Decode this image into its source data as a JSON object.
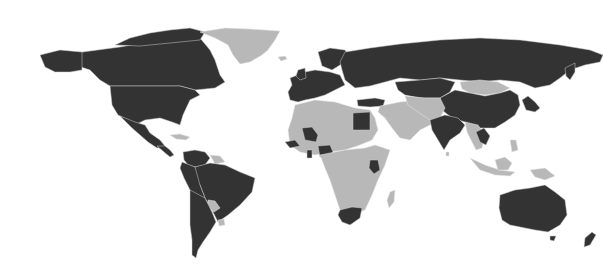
{
  "map": {
    "type": "world-choropleth",
    "projection": "equirectangular-like",
    "legend": "none",
    "categories": [
      {
        "name": "dark",
        "color": "#333333"
      },
      {
        "name": "light",
        "color": "#b8b8b8"
      }
    ],
    "background": "#ffffff",
    "regions": [
      {
        "id": "canada",
        "name": "Canada",
        "category": "dark",
        "points": "60,55 120,47 150,42 180,40 200,38 210,50 215,60 220,75 225,82 215,88 195,90 180,86 160,86 110,86 100,80 90,70 75,65 60,62"
      },
      {
        "id": "canada-arctic",
        "name": "Canadian Arctic Islands",
        "category": "dark",
        "points": "115,45 130,38 150,33 170,30 190,28 205,32 200,40 180,42 160,44 140,46"
      },
      {
        "id": "alaska",
        "name": "Alaska (USA)",
        "category": "dark",
        "points": "40,55 60,50 82,52 82,70 70,72 55,72 45,67"
      },
      {
        "id": "usa",
        "name": "United States",
        "category": "dark",
        "points": "110,86 160,86 180,86 195,90 200,95 190,100 183,115 180,125 172,122 160,118 145,120 135,125 128,120 118,115 112,105"
      },
      {
        "id": "mexico",
        "name": "Mexico",
        "category": "dark",
        "points": "120,116 135,122 145,125 150,133 160,140 165,146 157,148 148,142 140,135 132,128"
      },
      {
        "id": "central-america",
        "name": "Central America",
        "category": "dark",
        "points": "157,146 165,146 170,150 174,155 170,157 164,152"
      },
      {
        "id": "caribbean",
        "name": "Caribbean",
        "category": "light",
        "points": "170,135 180,134 190,137 186,140 176,139"
      },
      {
        "id": "greenland",
        "name": "Greenland",
        "category": "light",
        "points": "200,32 225,28 250,29 280,31 275,40 268,50 262,55 250,62 240,64 233,55 228,45 215,38"
      },
      {
        "id": "iceland",
        "name": "Iceland",
        "category": "light",
        "points": "278,57 285,56 287,59 281,61"
      },
      {
        "id": "colombia-venezuela",
        "name": "Colombia/Venezuela",
        "category": "dark",
        "points": "183,152 195,150 205,152 210,158 205,165 195,167 188,165 184,160"
      },
      {
        "id": "guianas",
        "name": "Guianas",
        "category": "light",
        "points": "210,155 220,156 225,162 215,164"
      },
      {
        "id": "brazil",
        "name": "Brazil",
        "category": "dark",
        "points": "195,167 210,163 225,165 240,172 255,178 252,192 240,205 228,215 218,222 212,210 205,198 200,185 195,178"
      },
      {
        "id": "peru-bolivia",
        "name": "Peru/Ecuador/Bolivia",
        "category": "dark",
        "points": "182,162 195,167 200,185 205,198 196,200 190,190 184,178 180,168"
      },
      {
        "id": "paraguay",
        "name": "Paraguay",
        "category": "light",
        "points": "208,200 215,201 220,208 214,212 208,206"
      },
      {
        "id": "uruguay",
        "name": "Uruguay",
        "category": "light",
        "points": "218,220 224,219 225,225 219,226"
      },
      {
        "id": "argentina-chile",
        "name": "Argentina/Chile",
        "category": "dark",
        "points": "190,190 205,198 212,212 216,222 210,232 203,242 198,250 196,258 192,255 192,240 190,225 190,210"
      },
      {
        "id": "western-europe",
        "name": "Western Europe",
        "category": "dark",
        "points": "290,78 305,72 315,70 330,72 340,75 345,85 335,90 325,95 315,98 305,100 298,102 290,100 288,92 292,85"
      },
      {
        "id": "scandinavia",
        "name": "Scandinavia",
        "category": "dark",
        "points": "318,52 330,48 345,50 350,58 340,65 332,70 322,66"
      },
      {
        "id": "uk-ireland",
        "name": "UK/Ireland",
        "category": "dark",
        "points": "298,70 305,68 306,78 300,80 296,76"
      },
      {
        "id": "russia",
        "name": "Russia",
        "category": "dark",
        "points": "345,52 370,48 400,44 440,40 480,38 520,40 560,45 590,50 603,55 600,62 585,65 570,70 560,78 550,85 535,88 520,82 500,80 480,82 460,80 440,78 420,80 400,78 385,82 370,86 355,88 345,80 342,70 340,62"
      },
      {
        "id": "kamchatka",
        "name": "Kamchatka",
        "category": "dark",
        "points": "565,68 575,63 575,72 570,80 566,76"
      },
      {
        "id": "kazakhstan-central-asia",
        "name": "Kazakhstan/Central Asia",
        "category": "dark",
        "points": "395,82 420,80 440,78 455,82 450,92 440,98 420,98 405,95 398,90"
      },
      {
        "id": "turkey",
        "name": "Turkey",
        "category": "dark",
        "points": "357,100 375,98 385,100 383,106 370,107 358,106"
      },
      {
        "id": "mongolia",
        "name": "Mongolia",
        "category": "light",
        "points": "460,82 480,80 498,82 510,88 500,93 485,95 470,93 462,89"
      },
      {
        "id": "china",
        "name": "China",
        "category": "dark",
        "points": "440,98 455,90 470,93 485,96 500,93 510,90 518,95 520,105 515,115 505,122 495,128 480,128 465,122 452,118 442,110"
      },
      {
        "id": "korea-japan",
        "name": "Korea/Japan",
        "category": "dark",
        "points": "522,100 528,96 535,102 540,108 535,112 526,110"
      },
      {
        "id": "middle-east",
        "name": "Middle East/Arabia",
        "category": "light",
        "points": "380,106 400,102 420,100 435,102 440,110 440,120 430,125 420,130 410,140 400,138 392,128 385,118 378,112"
      },
      {
        "id": "iran-afghanistan",
        "name": "Iran/Afghanistan/Pakistan",
        "category": "light",
        "points": "405,96 425,98 440,98 445,108 440,118 430,120 418,112 408,105"
      },
      {
        "id": "india",
        "name": "India",
        "category": "dark",
        "points": "430,120 445,115 458,118 465,125 460,133 450,140 444,150 438,140 432,130"
      },
      {
        "id": "southeast-asia",
        "name": "Southeast Asia",
        "category": "light",
        "points": "465,122 478,125 485,135 482,148 476,150 472,142 467,132"
      },
      {
        "id": "thailand-vietnam",
        "name": "Thailand/Vietnam",
        "category": "dark",
        "points": "476,132 484,128 490,136 486,145 480,142"
      },
      {
        "id": "indonesia",
        "name": "Indonesia",
        "category": "light",
        "points": "470,158 485,165 500,170 515,172 510,176 495,175 480,170"
      },
      {
        "id": "borneo",
        "name": "Borneo",
        "category": "light",
        "points": "495,160 505,157 512,163 508,170 498,170"
      },
      {
        "id": "philippines",
        "name": "Philippines",
        "category": "light",
        "points": "510,140 516,140 518,150 512,152"
      },
      {
        "id": "papua",
        "name": "New Guinea",
        "category": "light",
        "points": "530,170 545,168 555,176 545,180 535,177"
      },
      {
        "id": "australia",
        "name": "Australia",
        "category": "dark",
        "points": "500,195 515,190 530,188 545,185 555,192 565,200 567,215 560,225 548,232 535,230 525,228 510,225 502,220 499,208"
      },
      {
        "id": "tasmania",
        "name": "Tasmania",
        "category": "dark",
        "points": "550,236 556,236 554,241 550,240"
      },
      {
        "id": "new-zealand",
        "name": "New Zealand",
        "category": "dark",
        "points": "585,238 592,232 596,235 590,245 584,247"
      },
      {
        "id": "north-africa",
        "name": "North Africa",
        "category": "light",
        "points": "295,105 315,100 335,102 355,108 370,110 375,118 378,130 372,140 360,145 345,150 330,152 315,155 300,152 290,145 288,130 292,118"
      },
      {
        "id": "egypt",
        "name": "Egypt",
        "category": "dark",
        "points": "353,113 370,112 370,130 353,130"
      },
      {
        "id": "mali-region",
        "name": "Mali/Niger region",
        "category": "dark",
        "points": "302,128 312,127 318,135 316,142 305,140"
      },
      {
        "id": "senegal-region",
        "name": "Senegal/Gambia region",
        "category": "dark",
        "points": "285,142 295,140 300,146 290,148"
      },
      {
        "id": "ghana",
        "name": "Ghana",
        "category": "dark",
        "points": "307,150 312,150 312,158 307,158"
      },
      {
        "id": "nigeria",
        "name": "Nigeria",
        "category": "dark",
        "points": "318,146 330,145 333,152 328,158 320,157"
      },
      {
        "id": "central-east-africa",
        "name": "Central/East Africa",
        "category": "light",
        "points": "320,155 345,150 365,148 375,145 390,150 385,165 378,180 372,195 365,210 352,215 340,210 335,195 330,180 325,168"
      },
      {
        "id": "kenya",
        "name": "Kenya",
        "category": "dark",
        "points": "370,160 378,160 380,170 374,174 369,168"
      },
      {
        "id": "south-africa",
        "name": "South Africa",
        "category": "dark",
        "points": "340,210 352,207 362,208 360,218 350,225 342,222 338,215"
      },
      {
        "id": "madagascar",
        "name": "Madagascar",
        "category": "light",
        "points": "390,192 395,190 394,202 389,208 387,200"
      },
      {
        "id": "sri-lanka",
        "name": "Sri Lanka",
        "category": "light",
        "points": "446,152 449,152 449,156 446,156"
      }
    ]
  }
}
